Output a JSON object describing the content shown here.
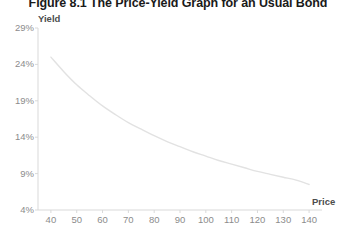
{
  "chart_data": {
    "type": "line",
    "title": "Figure 8.1 The Price-Yield Graph for an Usual Bond",
    "xlabel": "Price",
    "ylabel": "Yield",
    "grid": false,
    "legend": null,
    "xlim": [
      35,
      145
    ],
    "ylim": [
      4,
      29
    ],
    "xtick_labels": [
      "40",
      "50",
      "60",
      "70",
      "80",
      "90",
      "100",
      "110",
      "120",
      "130",
      "140"
    ],
    "xticks": [
      40,
      50,
      60,
      70,
      80,
      90,
      100,
      110,
      120,
      130,
      140
    ],
    "ytick_labels": [
      "29%",
      "24%",
      "19%",
      "14%",
      "9%",
      "4%"
    ],
    "yticks": [
      29,
      24,
      19,
      14,
      9,
      4
    ],
    "y_unit": "%",
    "series": [
      {
        "name": "Price-Yield Curve",
        "color": "#e2e2e2",
        "x": [
          40,
          45,
          50,
          55,
          60,
          65,
          70,
          75,
          80,
          85,
          90,
          95,
          100,
          105,
          110,
          115,
          120,
          125,
          130,
          135,
          140
        ],
        "values": [
          25.0,
          23.0,
          21.2,
          19.7,
          18.3,
          17.1,
          16.0,
          15.1,
          14.2,
          13.4,
          12.7,
          12.0,
          11.4,
          10.8,
          10.3,
          9.8,
          9.3,
          8.9,
          8.5,
          8.1,
          7.5
        ]
      }
    ]
  },
  "axes": {
    "y_label_text": "Yield",
    "x_label_text": "Price"
  },
  "colors": {
    "axis": "#d9d9d9",
    "tick_text": "#8c8c8c",
    "axis_title": "#4d4d4d",
    "series": "#e2e2e2",
    "title": "#1a1a1a",
    "background": "#ffffff"
  }
}
